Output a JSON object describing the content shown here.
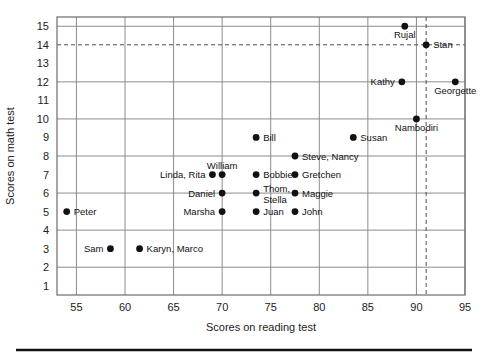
{
  "figure": {
    "x_axis_title": "Scores on reading test",
    "y_axis_title": "Scores on math test"
  },
  "chart_data": {
    "type": "scatter",
    "title": "",
    "xlabel": "Scores on reading test",
    "ylabel": "Scores on math test",
    "xlim": [
      53,
      95
    ],
    "ylim": [
      0.5,
      15.5
    ],
    "grid": true,
    "legend": "none",
    "x_ticks": [
      55,
      60,
      65,
      70,
      75,
      80,
      85,
      90,
      95
    ],
    "y_ticks": [
      1,
      2,
      3,
      4,
      5,
      6,
      7,
      8,
      9,
      10,
      11,
      12,
      13,
      14,
      15
    ],
    "x_gridlines": [
      55,
      60,
      65,
      70,
      75,
      80,
      85,
      90,
      95
    ],
    "y_gridlines": [
      2,
      4,
      6,
      8,
      10,
      12,
      15
    ],
    "reference_lines": [
      {
        "orientation": "horizontal",
        "value": 14,
        "style": "dashed"
      },
      {
        "orientation": "vertical",
        "value": 91,
        "style": "dashed"
      }
    ],
    "points": [
      {
        "label": "Peter",
        "x": 54,
        "y": 5,
        "label_pos": "right"
      },
      {
        "label": "Sam",
        "x": 58.5,
        "y": 3,
        "label_pos": "left"
      },
      {
        "label": "Karyn, Marco",
        "x": 61.5,
        "y": 3,
        "label_pos": "right"
      },
      {
        "label": "Linda, Rita",
        "x": 69,
        "y": 7,
        "label_pos": "left"
      },
      {
        "label": "William",
        "x": 70,
        "y": 7,
        "label_pos": "above"
      },
      {
        "label": "Daniel",
        "x": 70,
        "y": 6,
        "label_pos": "left"
      },
      {
        "label": "Marsha",
        "x": 70,
        "y": 5,
        "label_pos": "left"
      },
      {
        "label": "Bill",
        "x": 73.5,
        "y": 9,
        "label_pos": "right"
      },
      {
        "label": "Bobbie",
        "x": 73.5,
        "y": 7,
        "label_pos": "right"
      },
      {
        "label": "Thom, Stella",
        "x": 73.5,
        "y": 6,
        "label_pos": "right-2line"
      },
      {
        "label": "Juan",
        "x": 73.5,
        "y": 5,
        "label_pos": "right"
      },
      {
        "label": "Steve, Nancy",
        "x": 77.5,
        "y": 8,
        "label_pos": "right"
      },
      {
        "label": "Gretchen",
        "x": 77.5,
        "y": 7,
        "label_pos": "right"
      },
      {
        "label": "Maggie",
        "x": 77.5,
        "y": 6,
        "label_pos": "right"
      },
      {
        "label": "John",
        "x": 77.5,
        "y": 5,
        "label_pos": "right"
      },
      {
        "label": "Susan",
        "x": 83.5,
        "y": 9,
        "label_pos": "right"
      },
      {
        "label": "Kathy",
        "x": 88.5,
        "y": 12,
        "label_pos": "left"
      },
      {
        "label": "Rujal",
        "x": 88.8,
        "y": 15,
        "label_pos": "below"
      },
      {
        "label": "Nambodiri",
        "x": 90,
        "y": 10,
        "label_pos": "below"
      },
      {
        "label": "Stan",
        "x": 91,
        "y": 14,
        "label_pos": "right"
      },
      {
        "label": "Georgette",
        "x": 94,
        "y": 12,
        "label_pos": "below"
      }
    ]
  },
  "colors": {
    "point": "#111111",
    "grid": "#8c8c8c",
    "frame": "#6b6b6b",
    "dash": "#4d4d4d",
    "rule": "#111111"
  }
}
